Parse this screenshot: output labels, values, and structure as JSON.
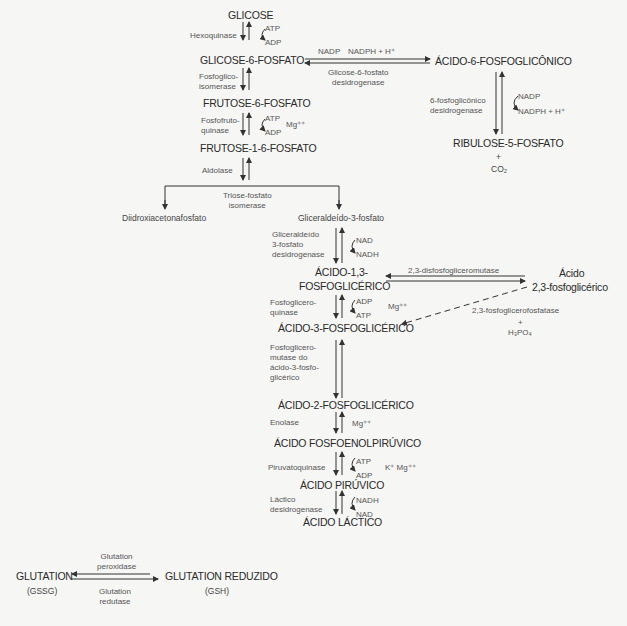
{
  "metabolites": {
    "glicose": "GLICOSE",
    "g6p": "GLICOSE-6-FOSFATO",
    "f6p": "FRUTOSE-6-FOSFATO",
    "f16p": "FRUTOSE-1-6-FOSFATO",
    "dhap": "Diidroxiacetonafosfato",
    "gap": "Gliceraldeído-3-fosfato",
    "bpg13_1": "ÁCIDO-1,3-",
    "bpg13_2": "FOSFOGLICÉRICO",
    "pg3": "ÁCIDO-3-FOSFOGLICÉRICO",
    "pg2": "ÁCIDO-2-FOSFOGLICÉRICO",
    "pep": "ÁCIDO FOSFOENOLPIRÚVICO",
    "pyr": "ÁCIDO PIRÚVICO",
    "lac": "ÁCIDO LÁCTICO",
    "pg6": "ÁCIDO-6-FOSFOGLICÔNICO",
    "ru5p": "RIBULOSE-5-FOSFATO",
    "ru5p_plus": "+",
    "co2": "CO₂",
    "bpg23_1": "Ácido",
    "bpg23_2": "2,3-fosfoglicérico",
    "gssg": "GLUTATION",
    "gssg_abbr": "(GSSG)",
    "gsh": "GLUTATION REDUZIDO",
    "gsh_abbr": "(GSH)"
  },
  "enzymes": {
    "hexoquinase": "Hexoquinase",
    "pgi_1": "Fosfoglico-",
    "pgi_2": "isomerase",
    "pfk_1": "Fosfofruto-",
    "pfk_2": "quinase",
    "aldolase": "Aldolase",
    "tpi_1": "Triose-fosfato",
    "tpi_2": "isomerase",
    "gapdh_1": "Gliceraldeído",
    "gapdh_2": "3-fosfato",
    "gapdh_3": "desidrogenase",
    "pgk_1": "Fosfoglicero-",
    "pgk_2": "quinase",
    "pgm_1": "Fosfoglicero-",
    "pgm_2": "mutase do",
    "pgm_3": "ácido-3-fosfo-",
    "pgm_4": "glicérico",
    "enolase": "Enolase",
    "pk": "Piruvatoquinase",
    "ldh_1": "Láctico",
    "ldh_2": "desidrogenase",
    "g6pd_1": "Glicose-6-fosfato",
    "g6pd_2": "desidrogenase",
    "pgd_1": "6-fosfoglicônico",
    "pgd_2": "desidrogenase",
    "bpgm": "2,3-disfosfogliceromutase",
    "bpgp": "2,3-fosfoglicerofosfatase",
    "gpx_1": "Glutation",
    "gpx_2": "peroxidase",
    "gr_1": "Glutation",
    "gr_2": "redutase"
  },
  "cofactors": {
    "hk_in": "ATP",
    "hk_out": "ADP",
    "pfk_in": "ATP",
    "pfk_out": "ADP",
    "pfk_ion": "Mg⁺⁺",
    "gapdh_in": "NAD",
    "gapdh_out": "NADH",
    "pgk_in": "ADP",
    "pgk_out": "ATP",
    "pgk_ion": "Mg⁺⁺",
    "enolase_ion": "Mg⁺⁺",
    "pk_in": "ATP",
    "pk_out": "ADP",
    "pk_ion": "K⁺ Mg⁺⁺",
    "ldh_in": "NADH",
    "ldh_out": "NAD",
    "g6pd_in": "NADP",
    "g6pd_out": "NADPH + H⁺",
    "pgd_in": "NADP",
    "pgd_out": "NADPH + H⁺",
    "bpgp_plus": "+",
    "bpgp_out": "H₃PO₄"
  }
}
